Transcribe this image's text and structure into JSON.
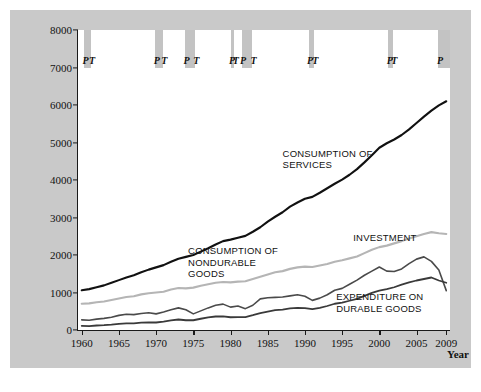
{
  "figure": {
    "background_color": "#c9c9c9",
    "canvas_color": "#ffffff",
    "recession_band_color": "#c3c3c3"
  },
  "axes": {
    "ylabel_line1": "Consumption and investment",
    "ylabel_line2": "(billions of chained (2005) dollars)",
    "xlabel": "Year"
  },
  "chart_data": {
    "type": "line",
    "title": "",
    "xlabel": "Year",
    "ylabel": "Consumption and investment (billions of chained (2005) dollars)",
    "xlim": [
      1959.5,
      2009.5
    ],
    "ylim": [
      0,
      8000
    ],
    "xticks": [
      1960,
      1965,
      1970,
      1975,
      1980,
      1985,
      1990,
      1995,
      2000,
      2005,
      2009
    ],
    "yticks": [
      0,
      1000,
      2000,
      3000,
      4000,
      5000,
      6000,
      7000,
      8000
    ],
    "grid": false,
    "legend": "inline-annotations",
    "x": [
      1960,
      1961,
      1962,
      1963,
      1964,
      1965,
      1966,
      1967,
      1968,
      1969,
      1970,
      1971,
      1972,
      1973,
      1974,
      1975,
      1976,
      1977,
      1978,
      1979,
      1980,
      1981,
      1982,
      1983,
      1984,
      1985,
      1986,
      1987,
      1988,
      1989,
      1990,
      1991,
      1992,
      1993,
      1994,
      1995,
      1996,
      1997,
      1998,
      1999,
      2000,
      2001,
      2002,
      2003,
      2004,
      2005,
      2006,
      2007,
      2008,
      2009
    ],
    "series": [
      {
        "name": "CONSUMPTION OF SERVICES",
        "color": "#111111",
        "width": 2.1,
        "values": [
          1060,
          1090,
          1140,
          1190,
          1260,
          1330,
          1400,
          1460,
          1540,
          1610,
          1670,
          1730,
          1820,
          1900,
          1950,
          2000,
          2090,
          2180,
          2280,
          2370,
          2410,
          2460,
          2510,
          2620,
          2740,
          2890,
          3020,
          3140,
          3290,
          3400,
          3500,
          3550,
          3660,
          3780,
          3900,
          4010,
          4140,
          4290,
          4470,
          4660,
          4860,
          4980,
          5080,
          5200,
          5350,
          5520,
          5690,
          5850,
          5990,
          6100
        ]
      },
      {
        "name": "CONSUMPTION OF NONDURABLE GOODS",
        "color": "#b5b5b5",
        "width": 2.1,
        "values": [
          700,
          710,
          740,
          760,
          800,
          840,
          880,
          900,
          950,
          980,
          1000,
          1020,
          1080,
          1120,
          1110,
          1130,
          1180,
          1220,
          1260,
          1280,
          1270,
          1290,
          1300,
          1360,
          1420,
          1480,
          1540,
          1570,
          1630,
          1670,
          1690,
          1680,
          1720,
          1760,
          1820,
          1860,
          1910,
          1960,
          2050,
          2140,
          2210,
          2250,
          2310,
          2370,
          2440,
          2500,
          2560,
          2610,
          2580,
          2560
        ]
      },
      {
        "name": "INVESTMENT",
        "color": "#4a4a4a",
        "width": 1.6,
        "values": [
          270,
          260,
          290,
          310,
          340,
          390,
          420,
          410,
          440,
          460,
          430,
          480,
          540,
          590,
          540,
          430,
          510,
          590,
          660,
          690,
          610,
          640,
          570,
          660,
          830,
          860,
          870,
          880,
          910,
          940,
          900,
          790,
          850,
          940,
          1060,
          1110,
          1220,
          1330,
          1460,
          1570,
          1680,
          1570,
          1560,
          1630,
          1770,
          1890,
          1950,
          1830,
          1600,
          1050
        ]
      },
      {
        "name": "EXPENDITURE ON DURABLE GOODS",
        "color": "#3a3a3a",
        "width": 1.8,
        "values": [
          110,
          105,
          120,
          130,
          145,
          165,
          175,
          175,
          195,
          205,
          200,
          225,
          255,
          280,
          260,
          260,
          300,
          335,
          360,
          365,
          340,
          345,
          345,
          395,
          450,
          490,
          530,
          545,
          575,
          590,
          585,
          555,
          590,
          640,
          700,
          730,
          780,
          830,
          910,
          990,
          1050,
          1090,
          1140,
          1210,
          1270,
          1320,
          1360,
          1400,
          1320,
          1260
        ]
      }
    ],
    "recessions": [
      {
        "peak": 1960.3,
        "trough": 1961.2,
        "labels": [
          "P",
          "T"
        ]
      },
      {
        "peak": 1969.9,
        "trough": 1970.9,
        "labels": [
          "P",
          "T"
        ]
      },
      {
        "peak": 1973.9,
        "trough": 1975.2,
        "labels": [
          "P",
          "T"
        ]
      },
      {
        "peak": 1980.0,
        "trough": 1980.5,
        "labels": [
          "P",
          "T"
        ]
      },
      {
        "peak": 1981.5,
        "trough": 1982.9,
        "labels": [
          "P",
          "T"
        ]
      },
      {
        "peak": 1990.5,
        "trough": 1991.2,
        "labels": [
          "P",
          "T"
        ]
      },
      {
        "peak": 2001.2,
        "trough": 2001.8,
        "labels": [
          "P",
          "T"
        ]
      },
      {
        "peak": 2007.9,
        "trough": 2009.5,
        "labels": [
          "P"
        ]
      }
    ],
    "annotations": [
      {
        "text": "CONSUMPTION OF\nSERVICES",
        "x": 1987.0,
        "y": 4700
      },
      {
        "text": "CONSUMPTION OF\nNONDURABLE\nGOODS",
        "x": 1974.3,
        "y": 2100
      },
      {
        "text": "INVESTMENT",
        "x": 1996.5,
        "y": 2450
      },
      {
        "text": "EXPENDITURE ON\nDURABLE GOODS",
        "x": 1994.2,
        "y": 880
      }
    ]
  }
}
